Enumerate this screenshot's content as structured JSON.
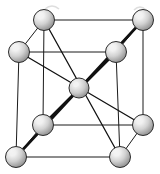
{
  "figure": {
    "name": "body-centered-cubic-unit-cell",
    "background_color": "#ffffff",
    "width": 160,
    "height": 174
  },
  "style": {
    "edge_color": "#1a1a1a",
    "edge_width": 1.0,
    "bond_color": "#111111",
    "bond_width": 1.3,
    "bond_width_thick": 2.6,
    "sphere_outline_color": "#2b2b2b",
    "sphere_outline_width": 1.0,
    "sphere_highlight_color": "#f2f2f2",
    "sphere_mid_color": "#c9c9c9",
    "sphere_shadow_color": "#8a8a8a",
    "sphere_radius": 10.5,
    "center_sphere_radius": 10.0,
    "artifact_color": "#d8d8d8"
  },
  "atoms": [
    {
      "id": "front-top-left",
      "label": "corner atom front top left",
      "x": 19,
      "y": 52,
      "r": 10.5,
      "layer": "front"
    },
    {
      "id": "front-top-right",
      "label": "corner atom front top right",
      "x": 116,
      "y": 52,
      "r": 10.5,
      "layer": "front"
    },
    {
      "id": "front-bottom-left",
      "label": "corner atom front bottom left",
      "x": 16,
      "y": 157,
      "r": 10.5,
      "layer": "front"
    },
    {
      "id": "front-bottom-right",
      "label": "corner atom front bottom right",
      "x": 120,
      "y": 157,
      "r": 10.5,
      "layer": "front"
    },
    {
      "id": "back-top-left",
      "label": "corner atom back top left",
      "x": 44,
      "y": 20,
      "r": 10.5,
      "layer": "back"
    },
    {
      "id": "back-top-right",
      "label": "corner atom back top right",
      "x": 143,
      "y": 20,
      "r": 10.5,
      "layer": "back"
    },
    {
      "id": "back-bottom-left",
      "label": "corner atom back bottom left",
      "x": 43,
      "y": 125,
      "r": 10.5,
      "layer": "back"
    },
    {
      "id": "back-bottom-right",
      "label": "corner atom back bottom right",
      "x": 143,
      "y": 125,
      "r": 10.5,
      "layer": "back"
    },
    {
      "id": "body-center",
      "label": "body-center atom",
      "x": 79,
      "y": 88,
      "r": 10.0,
      "layer": "center"
    }
  ],
  "cell_edges": [
    {
      "id": "front-top",
      "from": "front-top-left",
      "to": "front-top-right",
      "kind": "edge"
    },
    {
      "id": "front-bottom",
      "from": "front-bottom-left",
      "to": "front-bottom-right",
      "kind": "edge"
    },
    {
      "id": "front-left",
      "from": "front-top-left",
      "to": "front-bottom-left",
      "kind": "edge"
    },
    {
      "id": "front-right",
      "from": "front-top-right",
      "to": "front-bottom-right",
      "kind": "edge"
    },
    {
      "id": "back-top",
      "from": "back-top-left",
      "to": "back-top-right",
      "kind": "edge"
    },
    {
      "id": "back-bottom",
      "from": "back-bottom-left",
      "to": "back-bottom-right",
      "kind": "edge"
    },
    {
      "id": "back-left",
      "from": "back-top-left",
      "to": "back-bottom-left",
      "kind": "edge"
    },
    {
      "id": "back-right",
      "from": "back-top-right",
      "to": "back-bottom-right",
      "kind": "edge"
    },
    {
      "id": "depth-top-left",
      "from": "front-top-left",
      "to": "back-top-left",
      "kind": "edge"
    },
    {
      "id": "depth-top-right",
      "from": "front-top-right",
      "to": "back-top-right",
      "kind": "edge"
    },
    {
      "id": "depth-bot-left",
      "from": "front-bottom-left",
      "to": "back-bottom-left",
      "kind": "edge"
    },
    {
      "id": "depth-bot-right",
      "from": "front-bottom-right",
      "to": "back-bottom-right",
      "kind": "edge"
    }
  ],
  "body_diagonals": [
    {
      "id": "diag-ftl-bbr",
      "from": "front-top-left",
      "to": "back-bottom-right",
      "weight": "thin"
    },
    {
      "id": "diag-btr-fbl",
      "from": "back-top-right",
      "to": "front-bottom-left",
      "weight": "thick"
    },
    {
      "id": "diag-btl-fbr",
      "from": "back-top-left",
      "to": "front-bottom-right",
      "weight": "thin"
    },
    {
      "id": "diag-ftr-bbl",
      "from": "front-top-right",
      "to": "back-bottom-left",
      "weight": "thick"
    }
  ],
  "scan_artifacts": [
    {
      "id": "artifact-top-left",
      "x": 45,
      "y": 6,
      "w": 14,
      "h": 3
    },
    {
      "id": "artifact-top-right",
      "x": 134,
      "y": 7,
      "w": 12,
      "h": 3
    }
  ],
  "chart_data": {
    "type": "diagram",
    "atom_count": 9,
    "corner_atoms": 8,
    "center_atoms": 1,
    "coordination_number": 8,
    "projection": "oblique (cavalier)",
    "depth_offset": {
      "dx": 26,
      "dy": -32
    }
  }
}
